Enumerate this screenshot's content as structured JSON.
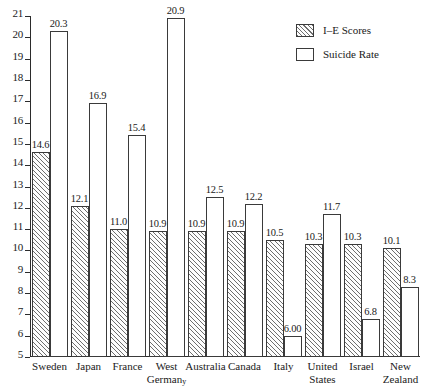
{
  "chart_data": {
    "type": "bar",
    "title": "",
    "xlabel": "",
    "ylabel": "",
    "ylim": [
      5,
      21
    ],
    "grid": false,
    "legend_position": "top-right",
    "yticks": [
      "21",
      "20",
      "19",
      "18",
      "17",
      "16",
      "15",
      "14",
      "13",
      "12",
      "11",
      "10",
      "9",
      "8",
      "7",
      "6",
      "5"
    ],
    "categories": [
      "Sweden",
      "Japan",
      "France",
      "West Germanᵧ",
      "Australia",
      "Canada",
      "Italy",
      "United States",
      "Israel",
      "New Zealand"
    ],
    "category_lines": [
      [
        "Sweden",
        ""
      ],
      [
        "Japan",
        ""
      ],
      [
        "France",
        ""
      ],
      [
        "West",
        "German"
      ],
      [
        "Australia",
        ""
      ],
      [
        "Canada",
        ""
      ],
      [
        "Italy",
        ""
      ],
      [
        "United",
        "States"
      ],
      [
        "Israel",
        ""
      ],
      [
        "New",
        "Zealand"
      ]
    ],
    "series": [
      {
        "name": "I-E Scores",
        "style": "hatched",
        "values": [
          14.6,
          12.1,
          11.0,
          10.9,
          10.9,
          10.9,
          10.5,
          10.3,
          10.3,
          10.1
        ],
        "labels": [
          "14.6",
          "12.1",
          "11.0",
          "10.9",
          "10.9",
          "10.9",
          "10.5",
          "10.3",
          "10.3",
          "10.1"
        ]
      },
      {
        "name": "Suicide Rate",
        "style": "outline",
        "values": [
          20.3,
          16.9,
          15.4,
          20.9,
          12.5,
          12.2,
          6.0,
          11.7,
          6.8,
          8.3
        ],
        "labels": [
          "20.3",
          "16.9",
          "15.4",
          "20.9",
          "12.5",
          "12.2",
          "6.00",
          "11.7",
          "6.8",
          "8.3"
        ]
      }
    ]
  },
  "legend": {
    "items": [
      {
        "label": "I–E Scores",
        "style": "hatched"
      },
      {
        "label": "Suicide Rate",
        "style": "outline"
      }
    ]
  }
}
